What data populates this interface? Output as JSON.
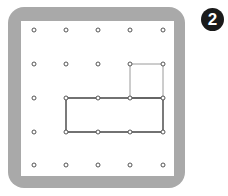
{
  "badge": {
    "label": "2"
  },
  "colors": {
    "frame": "#a9a9a9",
    "board": "#ffffff",
    "peg_stroke": "#555555",
    "square_stroke": "#9a9a9a",
    "rectangle_stroke": "#444444",
    "badge_bg": "#1a1a1a"
  },
  "geoboard": {
    "rows": 5,
    "cols": 5,
    "peg_x": [
      34,
      66,
      98,
      130,
      163
    ],
    "peg_y": [
      30,
      64,
      98,
      132,
      165
    ],
    "shapes": [
      {
        "name": "small-square",
        "corners_grid": [
          [
            3,
            1
          ],
          [
            4,
            1
          ],
          [
            4,
            2
          ],
          [
            3,
            2
          ]
        ],
        "style": "light"
      },
      {
        "name": "rectangle",
        "corners_grid": [
          [
            1,
            2
          ],
          [
            4,
            2
          ],
          [
            4,
            3
          ],
          [
            1,
            3
          ]
        ],
        "style": "dark"
      }
    ]
  }
}
